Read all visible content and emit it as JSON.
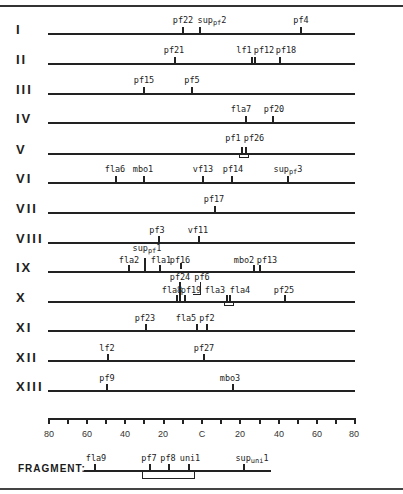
{
  "scale": {
    "ticks": [
      "80",
      "60",
      "40",
      "20",
      "C",
      "20",
      "40",
      "60",
      "80"
    ],
    "tick_step": 10,
    "range": [
      -80,
      80
    ]
  },
  "linkage_groups": [
    {
      "name": "I",
      "y": 34,
      "markers": [
        {
          "label": "pf22",
          "pos": -10
        },
        {
          "label": "sup",
          "sub": "pf",
          "suffix": "2",
          "pos": 0
        },
        {
          "label": "pf4",
          "pos": 52
        }
      ]
    },
    {
      "name": "II",
      "y": 63,
      "markers": [
        {
          "label": "pf21",
          "pos": -14
        },
        {
          "label": "lf1",
          "pos": 23
        },
        {
          "label": "pf12",
          "pos": 25
        },
        {
          "label": "pf18",
          "pos": 38
        }
      ]
    },
    {
      "name": "III",
      "y": 93,
      "markers": [
        {
          "label": "pf15",
          "pos": -30
        },
        {
          "label": "pf5",
          "pos": -5
        }
      ]
    },
    {
      "name": "IV",
      "y": 122,
      "markers": [
        {
          "label": "fla7",
          "pos": 20
        },
        {
          "label": "pf20",
          "pos": 34
        }
      ]
    },
    {
      "name": "V",
      "y": 153,
      "markers": [
        {
          "label": "pf1",
          "pos": 13
        },
        {
          "label": "pf26",
          "pos": 15
        }
      ]
    },
    {
      "name": "VI",
      "y": 182,
      "markers": [
        {
          "label": "fla6",
          "pos": -45
        },
        {
          "label": "mbo1",
          "pos": -30
        },
        {
          "label": "vf13",
          "pos": 1
        },
        {
          "label": "pf14",
          "pos": 16
        },
        {
          "label": "sup",
          "sub": "pf",
          "suffix": "3",
          "pos": 41
        }
      ]
    },
    {
      "name": "VII",
      "y": 212,
      "markers": [
        {
          "label": "pf17",
          "pos": 6
        }
      ]
    },
    {
      "name": "VIII",
      "y": 242,
      "markers": [
        {
          "label": "pf3",
          "pos": -23
        },
        {
          "label": "vf11",
          "pos": -2
        }
      ]
    },
    {
      "name": "IX",
      "y": 271,
      "markers": [
        {
          "label": "fla2",
          "pos": -37
        },
        {
          "label": "sup",
          "sub": "pf",
          "suffix": "1",
          "pos": -29
        },
        {
          "label": "fla1",
          "pos": -21
        },
        {
          "label": "pf16",
          "pos": -11
        },
        {
          "label": "mbo2",
          "pos": 27
        },
        {
          "label": "pf13",
          "pos": 29
        }
      ]
    },
    {
      "name": "X",
      "y": 301,
      "markers": [
        {
          "label": "fla8",
          "pos": -12
        },
        {
          "label": "pf24",
          "pos": -11
        },
        {
          "label": "pf19",
          "pos": -8
        },
        {
          "label": "pf6",
          "pos": -4
        },
        {
          "label": "fla3",
          "pos": 4
        },
        {
          "label": "fla4",
          "pos": 6
        },
        {
          "label": "pf25",
          "pos": 42
        }
      ]
    },
    {
      "name": "XI",
      "y": 331,
      "markers": [
        {
          "label": "pf23",
          "pos": -29
        },
        {
          "label": "fla5",
          "pos": -3
        },
        {
          "label": "pf2",
          "pos": 2
        }
      ]
    },
    {
      "name": "XII",
      "y": 361,
      "markers": [
        {
          "label": "lf2",
          "pos": -49
        },
        {
          "label": "pf27",
          "pos": 1
        }
      ]
    },
    {
      "name": "XIII",
      "y": 390,
      "markers": [
        {
          "label": "pf9",
          "pos": -49
        },
        {
          "label": "mbo3",
          "pos": 16
        }
      ]
    }
  ],
  "fragment": {
    "label": "FRAGMENT:",
    "markers": [
      {
        "label": "fla9",
        "pos": -55
      },
      {
        "label": "pf7",
        "pos": -25
      },
      {
        "label": "pf8",
        "pos": -15
      },
      {
        "label": "uni1",
        "pos": -5
      },
      {
        "label": "sup",
        "sub": "uni",
        "suffix": "1",
        "pos": 22
      }
    ]
  }
}
